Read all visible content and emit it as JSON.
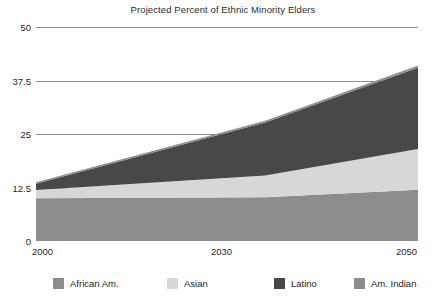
{
  "chart_data": {
    "type": "area",
    "title": "Projected Percent of Ethnic Minority Elders",
    "xlabel": "",
    "ylabel": "",
    "stacked": true,
    "grid": true,
    "legend_position": "bottom",
    "x": [
      2000,
      2030,
      2050
    ],
    "xlim": [
      2000,
      2050
    ],
    "ylim": [
      0,
      50
    ],
    "xticks": [
      "2000",
      "2030",
      "2050"
    ],
    "yticks": [
      "0",
      "12.5",
      "25",
      "37.5",
      "50"
    ],
    "ytick_values": [
      0,
      12.5,
      25,
      37.5,
      50
    ],
    "series": [
      {
        "name": "African Am.",
        "color": "#8c8c8c",
        "values": [
          10.0,
          10.2,
          12.0
        ]
      },
      {
        "name": "Asian",
        "color": "#d7d7d7",
        "values": [
          1.9,
          5.1,
          9.5
        ]
      },
      {
        "name": "Latino",
        "color": "#484848",
        "values": [
          1.5,
          12.4,
          19.0
        ]
      },
      {
        "name": "Am. Indian",
        "color": "#8c8c8c",
        "values": [
          0.3,
          0.4,
          0.5
        ]
      }
    ],
    "totals": [
      13.7,
      28.1,
      41.0
    ]
  },
  "axis": {
    "y_labels": [
      "50",
      "37.5",
      "25",
      "12.5",
      "0"
    ],
    "x_labels": [
      "2000",
      "2030",
      "2050"
    ]
  },
  "legend": {
    "items": [
      {
        "label": "African Am.",
        "color": "#8c8c8c"
      },
      {
        "label": "Asian",
        "color": "#d7d7d7"
      },
      {
        "label": "Latino",
        "color": "#484848"
      },
      {
        "label": "Am. Indian",
        "color": "#8c8c8c"
      }
    ]
  },
  "colors": {
    "gridline": "#8d8d8d",
    "background": "#ffffff",
    "text": "#1f1f1f"
  }
}
